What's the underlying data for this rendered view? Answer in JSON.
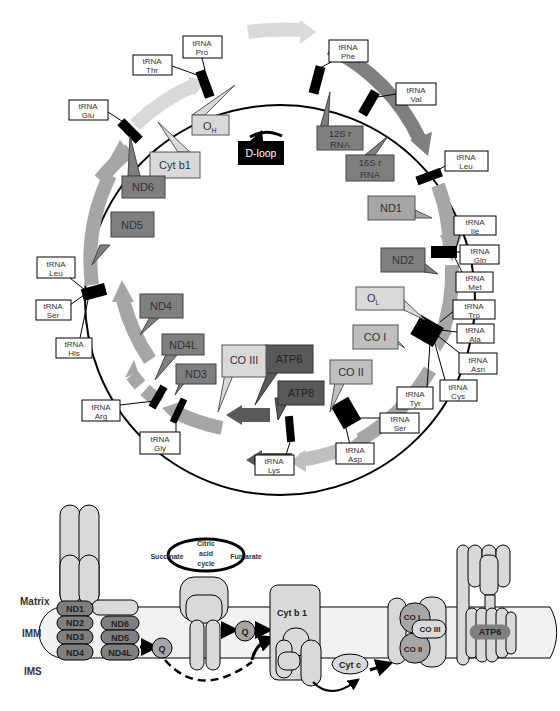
{
  "genome_map": {
    "trna": {
      "pro": [
        "tRNA",
        "Pro"
      ],
      "thr": [
        "tRNA",
        "Thr"
      ],
      "phe": [
        "tRNA",
        "Phe"
      ],
      "val": [
        "tRNA",
        "Val"
      ],
      "glu": [
        "tRNA",
        "Glu"
      ],
      "leu1": [
        "tRNA",
        "Leu"
      ],
      "ile": [
        "tRNA",
        "Ile"
      ],
      "gln": [
        "tRNA",
        "Gln"
      ],
      "met": [
        "tRNA",
        "Met"
      ],
      "trp": [
        "tRNA",
        "Trp"
      ],
      "ala": [
        "tRNA",
        "Ala"
      ],
      "asn": [
        "tRNA",
        "Asn"
      ],
      "cys": [
        "tRNA",
        "Cys"
      ],
      "tyr": [
        "tRNA",
        "Tyr"
      ],
      "ser1": [
        "tRNA",
        "Ser"
      ],
      "asp": [
        "tRNA",
        "Asp"
      ],
      "lys": [
        "tRNA",
        "Lys"
      ],
      "gly": [
        "tRNA",
        "Gly"
      ],
      "arg": [
        "tRNA",
        "Arg"
      ],
      "his": [
        "tRNA",
        "His"
      ],
      "ser2": [
        "tRNA",
        "Ser"
      ],
      "leu2": [
        "tRNA",
        "Leu"
      ]
    },
    "genes": {
      "oh": "O",
      "oh_sub": "H",
      "ol": "O",
      "ol_sub": "L",
      "dloop": "D-loop",
      "rrna12": [
        "12S r",
        "RNA"
      ],
      "rrna16": [
        "16S r",
        "RNA"
      ],
      "cytb": "Cyt b1",
      "nd6": "ND6",
      "nd5": "ND5",
      "nd1": "ND1",
      "nd2": "ND2",
      "nd4": "ND4",
      "nd4l": "ND4L",
      "nd3": "ND3",
      "co1": "CO I",
      "co2": "CO II",
      "co3": "CO III",
      "atp6": "ATP6",
      "atp8": "ATP8"
    }
  },
  "etc": {
    "regions": {
      "matrix": "Matrix",
      "imm": "IMM",
      "ims": "IMS"
    },
    "complex1": [
      "ND1",
      "ND2",
      "ND3",
      "ND4",
      "ND6",
      "ND5",
      "ND4L"
    ],
    "citric": {
      "line1": "Citric",
      "line2": "acid",
      "line3": "cycle",
      "left": "Succinate",
      "right": "Fumarate"
    },
    "q": "Q",
    "cytb": "Cyt b 1",
    "cytc": "Cyt c",
    "complex4": [
      "CO I",
      "CO III",
      "CO II"
    ],
    "atp": "ATP6"
  },
  "colors": {
    "light": "#d9d9d9",
    "mid": "#a6a6a6",
    "dark": "#7f7f7f",
    "darker": "#595959",
    "black": "#000000"
  }
}
